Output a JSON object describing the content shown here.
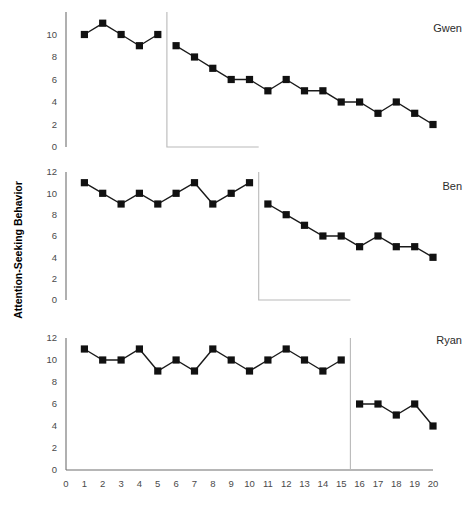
{
  "chart_data": {
    "type": "line",
    "title": "",
    "subtitle": "",
    "xlabel": "",
    "ylabel": "Attention-Seeking Behavior",
    "design": "multiple-baseline across participants",
    "grid": false,
    "legend_position": "none",
    "x": [
      1,
      2,
      3,
      4,
      5,
      6,
      7,
      8,
      9,
      10,
      11,
      12,
      13,
      14,
      15,
      16,
      17,
      18,
      19,
      20
    ],
    "xlim": [
      0,
      20
    ],
    "xticks": [
      "0",
      "1",
      "2",
      "3",
      "4",
      "5",
      "6",
      "7",
      "8",
      "9",
      "10",
      "11",
      "12",
      "13",
      "14",
      "15",
      "16",
      "17",
      "18",
      "19",
      "20"
    ],
    "panels": [
      {
        "name": "Gwen",
        "ylim": [
          0,
          12
        ],
        "yticks": [
          "0",
          "2",
          "4",
          "6",
          "8",
          "10"
        ],
        "ytick_values": [
          0,
          2,
          4,
          6,
          8,
          10
        ],
        "phase_change_after_x": 5,
        "series": [
          {
            "name": "Baseline",
            "x": [
              1,
              2,
              3,
              4,
              5
            ],
            "values": [
              10,
              11,
              10,
              9,
              10
            ]
          },
          {
            "name": "Intervention",
            "x": [
              6,
              7,
              8,
              9,
              10,
              11,
              12,
              13,
              14,
              15,
              16,
              17,
              18,
              19,
              20
            ],
            "values": [
              9,
              8,
              7,
              6,
              6,
              5,
              6,
              5,
              5,
              4,
              4,
              3,
              4,
              3,
              2
            ]
          }
        ]
      },
      {
        "name": "Ben",
        "ylim": [
          0,
          12
        ],
        "yticks": [
          "0",
          "2",
          "4",
          "6",
          "8",
          "10",
          "12"
        ],
        "ytick_values": [
          0,
          2,
          4,
          6,
          8,
          10,
          12
        ],
        "phase_change_after_x": 10,
        "series": [
          {
            "name": "Baseline",
            "x": [
              1,
              2,
              3,
              4,
              5,
              6,
              7,
              8,
              9,
              10
            ],
            "values": [
              11,
              10,
              9,
              10,
              9,
              10,
              11,
              9,
              10,
              11
            ]
          },
          {
            "name": "Intervention",
            "x": [
              11,
              12,
              13,
              14,
              15,
              16,
              17,
              18,
              19,
              20
            ],
            "values": [
              9,
              8,
              7,
              6,
              6,
              5,
              6,
              5,
              5,
              4
            ]
          }
        ]
      },
      {
        "name": "Ryan",
        "ylim": [
          0,
          12
        ],
        "yticks": [
          "0",
          "2",
          "4",
          "6",
          "8",
          "10",
          "12"
        ],
        "ytick_values": [
          0,
          2,
          4,
          6,
          8,
          10,
          12
        ],
        "phase_change_after_x": 15,
        "series": [
          {
            "name": "Baseline",
            "x": [
              1,
              2,
              3,
              4,
              5,
              6,
              7,
              8,
              9,
              10,
              11,
              12,
              13,
              14,
              15
            ],
            "values": [
              11,
              10,
              10,
              11,
              9,
              10,
              9,
              11,
              10,
              9,
              10,
              11,
              10,
              9,
              10
            ]
          },
          {
            "name": "Intervention",
            "x": [
              16,
              17,
              18,
              19,
              20
            ],
            "values": [
              6,
              6,
              5,
              6,
              4
            ]
          }
        ]
      }
    ]
  },
  "axis": {
    "y_title": "Attention-Seeking Behavior"
  },
  "colors": {
    "marker": "#111111",
    "line": "#1a1a1a",
    "axis": "#6f6f6f",
    "phase_line": "#b9b9b9",
    "tick_label": "#4a4a4a",
    "panel_label": "#2b2b2b",
    "background": "#ffffff"
  }
}
